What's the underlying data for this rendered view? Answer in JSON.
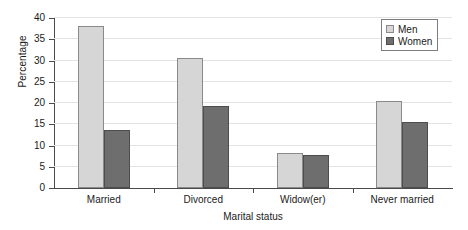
{
  "chart_data": {
    "type": "bar",
    "title": "",
    "xlabel": "Marital status",
    "ylabel": "Percentage",
    "categories": [
      "Married",
      "Divorced",
      "Widow(er)",
      "Never married"
    ],
    "series": [
      {
        "name": "Men",
        "color": "#d6d6d6",
        "values": [
          38.1,
          30.6,
          8.3,
          20.4
        ]
      },
      {
        "name": "Women",
        "color": "#6e6e6e",
        "values": [
          13.6,
          19.2,
          7.7,
          15.5
        ]
      }
    ],
    "ylim": [
      0,
      40
    ],
    "yticks": [
      0,
      5,
      10,
      15,
      20,
      25,
      30,
      35,
      40
    ],
    "ytick_labels": [
      "0",
      "5",
      "10",
      "15",
      "20",
      "25",
      "30",
      "35",
      "40"
    ],
    "grid": true,
    "legend_position": "top-right",
    "legend_entries": [
      "Men",
      "Women"
    ]
  }
}
